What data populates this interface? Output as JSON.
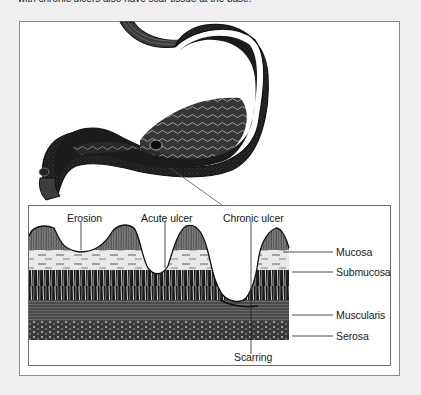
{
  "caption": "with chronic ulcers also have scar tissue at the base.",
  "figure": {
    "stomach_callout": "ulcer-site-pointer",
    "cross_section": {
      "top_labels": [
        {
          "id": "erosion",
          "text": "Erosion"
        },
        {
          "id": "acute-ulcer",
          "text": "Acute ulcer"
        },
        {
          "id": "chronic-ulcer",
          "text": "Chronic ulcer"
        }
      ],
      "layer_labels": [
        {
          "id": "mucosa",
          "text": "Mucosa"
        },
        {
          "id": "submucosa",
          "text": "Submucosa"
        },
        {
          "id": "muscularis",
          "text": "Muscularis"
        },
        {
          "id": "serosa",
          "text": "Serosa"
        }
      ],
      "bottom_label": {
        "id": "scarring",
        "text": "Scarring"
      }
    }
  },
  "colors": {
    "background": "#efefef",
    "frame": "#8a8a8a",
    "ink": "#1a1a1a",
    "tissue_dark": "#2a2a2a",
    "tissue_mid": "#6a6a6a",
    "tissue_light": "#d8d8d8"
  }
}
